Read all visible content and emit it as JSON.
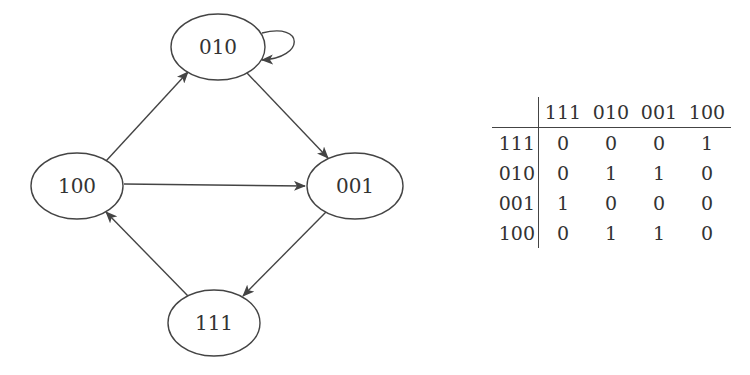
{
  "graph": {
    "nodes": [
      {
        "id": "010",
        "label": "010",
        "cx": 218,
        "cy": 47,
        "rx": 47,
        "ry": 33
      },
      {
        "id": "100",
        "label": "100",
        "cx": 77,
        "cy": 186,
        "rx": 46,
        "ry": 33
      },
      {
        "id": "001",
        "label": "001",
        "cx": 355,
        "cy": 186,
        "rx": 48,
        "ry": 33
      },
      {
        "id": "111",
        "label": "111",
        "cx": 214,
        "cy": 323,
        "rx": 46,
        "ry": 33
      }
    ],
    "edges": [
      {
        "from": "100",
        "to": "010"
      },
      {
        "from": "010",
        "to": "010"
      },
      {
        "from": "010",
        "to": "001"
      },
      {
        "from": "100",
        "to": "001"
      },
      {
        "from": "001",
        "to": "111"
      },
      {
        "from": "111",
        "to": "100"
      }
    ],
    "stroke_color": "#444444"
  },
  "matrix": {
    "columns": [
      "111",
      "010",
      "001",
      "100"
    ],
    "rows": [
      {
        "label": "111",
        "values": [
          "0",
          "0",
          "0",
          "1"
        ]
      },
      {
        "label": "010",
        "values": [
          "0",
          "1",
          "1",
          "0"
        ]
      },
      {
        "label": "001",
        "values": [
          "1",
          "0",
          "0",
          "0"
        ]
      },
      {
        "label": "100",
        "values": [
          "0",
          "1",
          "1",
          "0"
        ]
      }
    ]
  }
}
